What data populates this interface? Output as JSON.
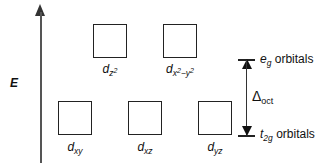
{
  "axis": {
    "label": "E",
    "direction": "up"
  },
  "levels": {
    "upper": {
      "symbol": "e",
      "subscript": "g",
      "suffix": " orbitals"
    },
    "lower": {
      "symbol": "t",
      "subscript": "2g",
      "suffix": " orbitals"
    }
  },
  "splitting": {
    "symbol": "Δ",
    "subscript": "oct"
  },
  "orbitals": {
    "eg": [
      {
        "base": "d",
        "sub": "z",
        "sup": "2"
      },
      {
        "base": "d",
        "sub": "x",
        "sup": "2",
        "sub_rest": "−y",
        "sup2": "2"
      }
    ],
    "t2g": [
      {
        "base": "d",
        "sub": "xy"
      },
      {
        "base": "d",
        "sub": "xz"
      },
      {
        "base": "d",
        "sub": "yz"
      }
    ]
  }
}
